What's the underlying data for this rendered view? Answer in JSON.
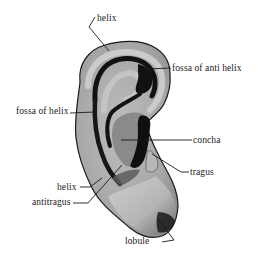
{
  "diagram": {
    "colors": {
      "background": "#ffffff",
      "skin_light": "#c8c8c8",
      "skin_mid": "#a9a9a9",
      "skin_dark": "#7c7c7c",
      "shadow": "#111111",
      "outline": "#1a1a1a",
      "label_text": "#1a1a1a"
    },
    "labels": [
      {
        "id": "helix-top",
        "text": "helix",
        "x": 97,
        "y": 13
      },
      {
        "id": "fossa-of-anti-helix",
        "text": "fossa of anti helix",
        "x": 172,
        "y": 63
      },
      {
        "id": "fossa-of-helix",
        "text": "fossa of helix",
        "x": 16,
        "y": 106
      },
      {
        "id": "concha",
        "text": "concha",
        "x": 193,
        "y": 135
      },
      {
        "id": "tragus",
        "text": "tragus",
        "x": 190,
        "y": 168
      },
      {
        "id": "helix-lower",
        "text": "helix",
        "x": 57,
        "y": 182
      },
      {
        "id": "antitragus",
        "text": "antitragus",
        "x": 32,
        "y": 197
      },
      {
        "id": "lobule",
        "text": "lobule",
        "x": 153,
        "y": 234
      }
    ]
  }
}
